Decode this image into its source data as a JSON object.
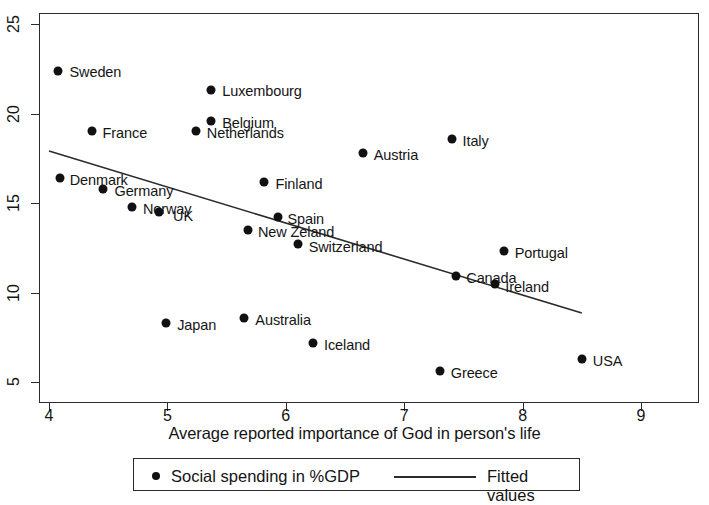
{
  "chart_data": {
    "type": "scatter",
    "title": "",
    "xlabel": "Average reported importance of God in person's life",
    "ylabel": "",
    "xlim": [
      4,
      9
    ],
    "ylim": [
      3.35,
      25.8
    ],
    "xticks": [
      4,
      5,
      6,
      7,
      8,
      9
    ],
    "yticks": [
      5,
      10,
      15,
      20,
      25
    ],
    "grid": false,
    "legend_position": "bottom",
    "series": [
      {
        "name": "Social spending in %GDP",
        "marker": "filled-circle",
        "points": [
          {
            "label": "Sweden",
            "x": 4.08,
            "y": 22.4,
            "label_dx": 11,
            "label_dy": -6
          },
          {
            "label": "Luxembourg",
            "x": 5.37,
            "y": 21.3,
            "label_dx": 11,
            "label_dy": -6
          },
          {
            "label": "Belgium",
            "x": 5.37,
            "y": 19.6,
            "label_dx": 11,
            "label_dy": -5
          },
          {
            "label": "France",
            "x": 4.36,
            "y": 19.0,
            "label_dx": 11,
            "label_dy": -5
          },
          {
            "label": "Netherlands",
            "x": 5.24,
            "y": 19.0,
            "label_dx": 11,
            "label_dy": -5
          },
          {
            "label": "Italy",
            "x": 7.4,
            "y": 18.6,
            "label_dx": 11,
            "label_dy": -5
          },
          {
            "label": "Austria",
            "x": 6.65,
            "y": 17.8,
            "label_dx": 11,
            "label_dy": -5
          },
          {
            "label": "Denmark",
            "x": 4.09,
            "y": 16.4,
            "label_dx": 10,
            "label_dy": -5
          },
          {
            "label": "Germany",
            "x": 4.46,
            "y": 15.8,
            "label_dx": 11,
            "label_dy": -5
          },
          {
            "label": "Finland",
            "x": 5.82,
            "y": 16.2,
            "label_dx": 11,
            "label_dy": -5
          },
          {
            "label": "Norway",
            "x": 4.7,
            "y": 14.8,
            "label_dx": 11,
            "label_dy": -5
          },
          {
            "label": "UK",
            "x": 4.93,
            "y": 14.5,
            "label_dx": 14,
            "label_dy": -3
          },
          {
            "label": "Spain",
            "x": 5.93,
            "y": 14.2,
            "label_dx": 10,
            "label_dy": -5
          },
          {
            "label": "New Zeland",
            "x": 5.68,
            "y": 13.5,
            "label_dx": 10,
            "label_dy": -5
          },
          {
            "label": "Switzerland",
            "x": 6.1,
            "y": 12.7,
            "label_dx": 11,
            "label_dy": -4
          },
          {
            "label": "Portugal",
            "x": 7.84,
            "y": 12.3,
            "label_dx": 11,
            "label_dy": -5
          },
          {
            "label": "Canada",
            "x": 7.44,
            "y": 10.9,
            "label_dx": 10,
            "label_dy": -5
          },
          {
            "label": "Ireland",
            "x": 7.77,
            "y": 10.5,
            "label_dx": 10,
            "label_dy": -4
          },
          {
            "label": "Australia",
            "x": 5.65,
            "y": 8.6,
            "label_dx": 11,
            "label_dy": -5
          },
          {
            "label": "Japan",
            "x": 4.99,
            "y": 8.3,
            "label_dx": 11,
            "label_dy": -5
          },
          {
            "label": "Iceland",
            "x": 6.23,
            "y": 7.2,
            "label_dx": 11,
            "label_dy": -5
          },
          {
            "label": "USA",
            "x": 8.5,
            "y": 6.3,
            "label_dx": 11,
            "label_dy": -5
          },
          {
            "label": "Greece",
            "x": 7.3,
            "y": 5.6,
            "label_dx": 11,
            "label_dy": -5
          }
        ]
      },
      {
        "name": "Fitted values",
        "type": "line",
        "x0": 4.0,
        "y0": 17.9,
        "x1": 8.5,
        "y1": 8.85
      }
    ]
  },
  "legend": {
    "scatter_label": "Social spending in %GDP",
    "line_label": "Fitted values"
  },
  "axis": {
    "x_title": "Average reported importance of God in person's life",
    "x_tick_labels": [
      "4",
      "5",
      "6",
      "7",
      "8",
      "9"
    ],
    "y_tick_labels": [
      "5",
      "10",
      "15",
      "20",
      "25"
    ]
  },
  "colors": {
    "marker": "#111111",
    "line": "#2b2b2b",
    "frame": "#2b2b2b",
    "text": "#141414",
    "background": "#ffffff"
  }
}
